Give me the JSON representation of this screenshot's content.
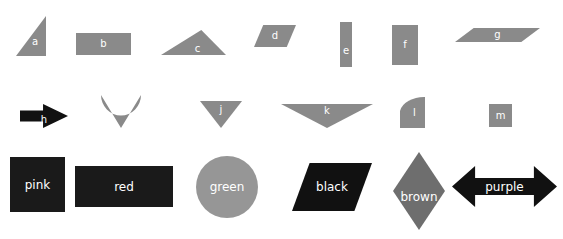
{
  "page": {
    "background_color": "#ffffff",
    "width": 563,
    "height": 239
  },
  "palette": {
    "gray": "#8a8a8a",
    "dark_gray": "#6e6e6e",
    "medium_gray": "#969696",
    "black": "#111111",
    "near_black": "#1a1a1a",
    "label_text": "#ffffff"
  },
  "rows": {
    "row1": {
      "name": "top-row",
      "shapes": [
        {
          "id": "a",
          "label": "a",
          "type": "right-triangle",
          "color": "#8a8a8a",
          "x": 16,
          "y": 16,
          "w": 30,
          "h": 40
        },
        {
          "id": "b",
          "label": "b",
          "type": "rectangle",
          "color": "#8a8a8a",
          "x": 76,
          "y": 33,
          "w": 55,
          "h": 22
        },
        {
          "id": "c",
          "label": "c",
          "type": "triangle",
          "color": "#8a8a8a",
          "x": 161,
          "y": 30,
          "w": 65,
          "h": 25
        },
        {
          "id": "d",
          "label": "d",
          "type": "parallelogram",
          "color": "#8a8a8a",
          "x": 254,
          "y": 25,
          "w": 42,
          "h": 22
        },
        {
          "id": "e",
          "label": "e",
          "type": "rectangle",
          "color": "#8a8a8a",
          "x": 340,
          "y": 22,
          "w": 12,
          "h": 45
        },
        {
          "id": "f",
          "label": "f",
          "type": "rectangle",
          "color": "#8a8a8a",
          "x": 392,
          "y": 25,
          "w": 26,
          "h": 40
        },
        {
          "id": "g",
          "label": "g",
          "type": "parallelogram",
          "color": "#8a8a8a",
          "x": 455,
          "y": 28,
          "w": 85,
          "h": 14
        }
      ]
    },
    "row2": {
      "name": "middle-row",
      "shapes": [
        {
          "id": "h",
          "label": "h",
          "type": "arrow-right",
          "color": "#111111",
          "x": 20,
          "y": 104,
          "w": 48,
          "h": 24
        },
        {
          "id": "i",
          "label": "i",
          "type": "fan-down",
          "color": "#8a8a8a",
          "x": 101,
          "y": 95,
          "w": 40,
          "h": 33
        },
        {
          "id": "j",
          "label": "j",
          "type": "triangle-down",
          "color": "#8a8a8a",
          "x": 200,
          "y": 101,
          "w": 42,
          "h": 27
        },
        {
          "id": "k",
          "label": "k",
          "type": "triangle-down",
          "color": "#8a8a8a",
          "x": 281,
          "y": 104,
          "w": 92,
          "h": 24
        },
        {
          "id": "l",
          "label": "l",
          "type": "quarter-round",
          "color": "#8a8a8a",
          "x": 400,
          "y": 97,
          "w": 25,
          "h": 31
        },
        {
          "id": "m",
          "label": "m",
          "type": "square",
          "color": "#8a8a8a",
          "x": 489,
          "y": 104,
          "w": 23,
          "h": 23
        }
      ]
    },
    "row3": {
      "name": "bottom-row",
      "shapes": [
        {
          "id": "pink",
          "label": "pink",
          "type": "square",
          "color": "#1a1a1a",
          "x": 10,
          "y": 157,
          "w": 55,
          "h": 55
        },
        {
          "id": "red",
          "label": "red",
          "type": "rectangle",
          "color": "#1a1a1a",
          "x": 75,
          "y": 166,
          "w": 98,
          "h": 41
        },
        {
          "id": "green",
          "label": "green",
          "type": "circle",
          "color": "#969696",
          "x": 196,
          "y": 156,
          "w": 62,
          "h": 62
        },
        {
          "id": "black",
          "label": "black",
          "type": "parallelogram",
          "color": "#111111",
          "x": 292,
          "y": 163,
          "w": 80,
          "h": 48
        },
        {
          "id": "brown",
          "label": "brown",
          "type": "diamond",
          "color": "#6e6e6e",
          "x": 393,
          "y": 152,
          "w": 52,
          "h": 78
        },
        {
          "id": "purple",
          "label": "purple",
          "type": "double-arrow",
          "color": "#111111",
          "x": 452,
          "y": 166,
          "w": 105,
          "h": 41
        }
      ]
    }
  }
}
